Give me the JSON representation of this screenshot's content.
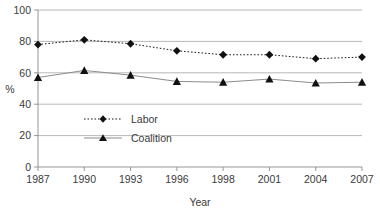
{
  "chart_data": {
    "type": "line",
    "title": "",
    "xlabel": "Year",
    "ylabel": "%",
    "categories": [
      "1987",
      "1990",
      "1993",
      "1996",
      "1998",
      "2001",
      "2004",
      "2007"
    ],
    "ylim": [
      0,
      100
    ],
    "yticks": [
      0,
      20,
      40,
      60,
      80,
      100
    ],
    "grid": true,
    "legend_position": "inside-left",
    "series": [
      {
        "name": "Labor",
        "marker": "diamond",
        "line_style": "dotted",
        "color": "#111111",
        "values": [
          78,
          81,
          78.5,
          74,
          71.5,
          71.5,
          69,
          70
        ]
      },
      {
        "name": "Coalition",
        "marker": "triangle",
        "line_style": "solid",
        "color": "#8c8c8c",
        "values": [
          57,
          61.5,
          58.5,
          54.5,
          54,
          56,
          53.5,
          54
        ]
      }
    ]
  },
  "axes": {
    "y_title": "%",
    "x_title": "Year",
    "y_tick_labels": [
      "0",
      "20",
      "40",
      "60",
      "80",
      "100"
    ],
    "x_tick_labels": [
      "1987",
      "1990",
      "1993",
      "1996",
      "1998",
      "2001",
      "2004",
      "2007"
    ]
  },
  "legend": {
    "entries": [
      {
        "label": "Labor"
      },
      {
        "label": "Coalition"
      }
    ]
  }
}
